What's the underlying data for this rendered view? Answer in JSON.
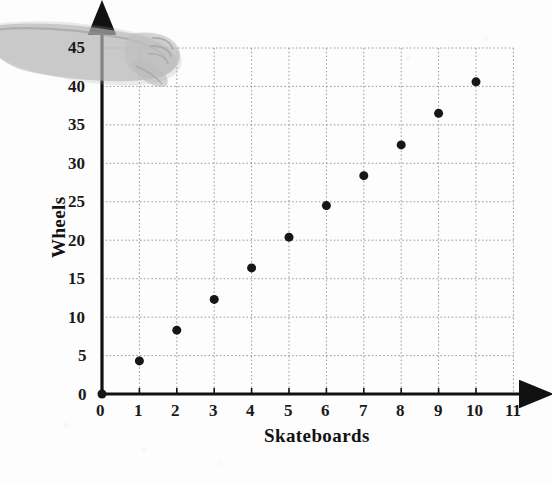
{
  "chart_data": {
    "type": "scatter",
    "title": "",
    "xlabel": "Skateboards",
    "ylabel": "Wheels",
    "xlim": [
      0,
      11
    ],
    "ylim": [
      0,
      45
    ],
    "grid": true,
    "legend": "none",
    "xticks": [
      "0",
      "1",
      "2",
      "3",
      "4",
      "5",
      "6",
      "7",
      "8",
      "9",
      "10",
      "11"
    ],
    "yticks": [
      "0",
      "5",
      "10",
      "15",
      "20",
      "25",
      "30",
      "35",
      "40",
      "45"
    ],
    "x": [
      0,
      1,
      2,
      3,
      4,
      5,
      6,
      7,
      8,
      9,
      10
    ],
    "y": [
      0,
      4.3,
      8.3,
      12.3,
      16.4,
      20.4,
      24.5,
      28.4,
      32.4,
      36.5,
      40.6
    ],
    "points": [
      {
        "x": 0,
        "y": 0
      },
      {
        "x": 1,
        "y": 4.3
      },
      {
        "x": 2,
        "y": 8.3
      },
      {
        "x": 3,
        "y": 12.3
      },
      {
        "x": 4,
        "y": 16.4
      },
      {
        "x": 5,
        "y": 20.4
      },
      {
        "x": 6,
        "y": 24.5
      },
      {
        "x": 7,
        "y": 28.4
      },
      {
        "x": 8,
        "y": 32.4
      },
      {
        "x": 9,
        "y": 36.5
      },
      {
        "x": 10,
        "y": 40.6
      }
    ],
    "marker": {
      "shape": "circle",
      "color": "#141414",
      "size": 9
    }
  },
  "axes": {
    "x_arrow": true,
    "y_arrow": true,
    "axis_color": "#111111",
    "grid_color": "#9a9a9a"
  },
  "artifacts": {
    "hand": "scanned-hand-and-forearm"
  }
}
